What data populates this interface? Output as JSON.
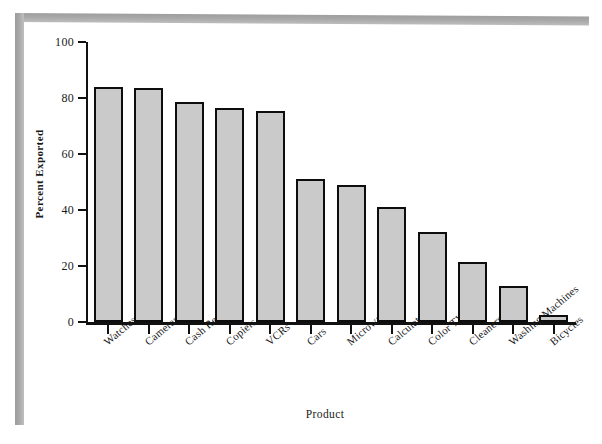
{
  "chart_data": {
    "type": "bar",
    "title": "",
    "xlabel": "Product",
    "ylabel": "Percent Exported",
    "ylim": [
      0,
      100
    ],
    "yticks": [
      0,
      20,
      40,
      60,
      80,
      100
    ],
    "grid": false,
    "legend": false,
    "bar_fill_color": "#cacaca",
    "bar_border_color": "#0d0d0d",
    "categories": [
      "Watches",
      "Cameras",
      "Cash Registers",
      "Copiers",
      "VCRs",
      "Cars",
      "Microwaves",
      "Calculators",
      "Color TVs",
      "Cleaners",
      "Washing Machines",
      "Bicycles"
    ],
    "values": [
      84,
      83.5,
      78.5,
      76.5,
      75.5,
      51,
      49,
      41,
      32,
      21.5,
      13,
      2.5
    ]
  },
  "figure": {
    "page_background": "#ffffff",
    "edge_band_color": "#a8a8a8"
  }
}
